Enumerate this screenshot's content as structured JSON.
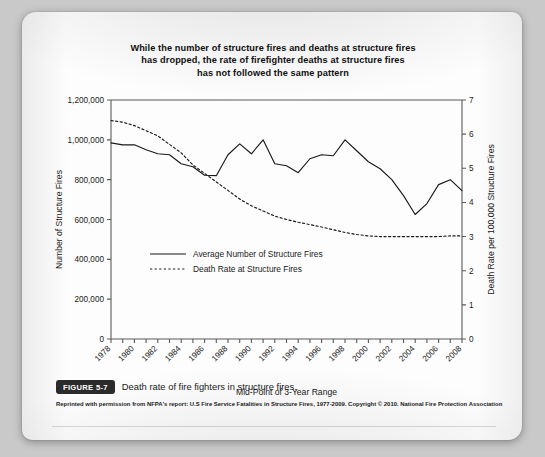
{
  "figure": {
    "badge": "FIGURE 5-7",
    "caption": "Death rate of fire fighters in structure fires.",
    "attribution": "Reprinted with permission from NFPA's report: U.S Fire Service Fatalities in Structure Fires, 1977-2009. Copyright © 2010. National Fire Protection Association"
  },
  "chart_data": {
    "type": "line",
    "title": "While the number of structure fires and deaths at structure fires has dropped, the rate of firefighter deaths at structure fires has not followed the same pattern",
    "title_lines": [
      "While the number of structure fires and deaths at structure fires",
      "has dropped, the rate of firefighter deaths at structure fires",
      "has not followed the same pattern"
    ],
    "xlabel": "Mid-Point of 3-Year Range",
    "ylabel": "Number of Structure Fires",
    "y2label": "Death Rate per 100,000 Structure Fires",
    "xlim": [
      1978,
      2008
    ],
    "ylim": [
      0,
      1200000
    ],
    "y2lim": [
      0,
      7
    ],
    "grid": false,
    "legend_position": "center-left",
    "y_ticks": [
      0,
      200000,
      400000,
      600000,
      800000,
      1000000,
      1200000
    ],
    "y_tick_labels": [
      "0",
      "200,000",
      "400,000",
      "600,000",
      "800,000",
      "1,000,000",
      "1,200,000"
    ],
    "y2_ticks": [
      0,
      1,
      2,
      3,
      4,
      5,
      6,
      7
    ],
    "y2_tick_labels": [
      "0",
      "1",
      "2",
      "3",
      "4",
      "5",
      "6",
      "7"
    ],
    "x_ticks": [
      1978,
      1979,
      1980,
      1981,
      1982,
      1983,
      1984,
      1985,
      1986,
      1987,
      1988,
      1989,
      1990,
      1991,
      1992,
      1993,
      1994,
      1995,
      1996,
      1997,
      1998,
      1999,
      2000,
      2001,
      2002,
      2003,
      2004,
      2005,
      2006,
      2007,
      2008
    ],
    "x_tick_labels_shown": [
      "1978",
      "1980",
      "1982",
      "1984",
      "1986",
      "1988",
      "1990",
      "1992",
      "1994",
      "1996",
      "1998",
      "2000",
      "2002",
      "2004",
      "2006",
      "2008"
    ],
    "x": [
      1978,
      1979,
      1980,
      1981,
      1982,
      1983,
      1984,
      1985,
      1986,
      1987,
      1988,
      1989,
      1990,
      1991,
      1992,
      1993,
      1994,
      1995,
      1996,
      1997,
      1998,
      1999,
      2000,
      2001,
      2002,
      2003,
      2004,
      2005,
      2006,
      2007,
      2008
    ],
    "series": [
      {
        "name": "Average Number of Structure Fires",
        "axis": "left",
        "style": "solid",
        "color": "#1a1a1a",
        "values": [
          985000,
          975000,
          975000,
          950000,
          930000,
          925000,
          880000,
          865000,
          822000,
          820000,
          925000,
          980000,
          930000,
          1000000,
          880000,
          870000,
          835000,
          905000,
          925000,
          920000,
          1000000,
          945000,
          890000,
          855000,
          800000,
          720000,
          625000,
          680000,
          775000,
          800000,
          745000
        ]
      },
      {
        "name": "Death Rate at Structure Fires",
        "axis": "right",
        "style": "dashed",
        "color": "#1a1a1a",
        "values": [
          6.4,
          6.35,
          6.25,
          6.1,
          5.95,
          5.7,
          5.45,
          5.1,
          4.85,
          4.6,
          4.35,
          4.1,
          3.9,
          3.75,
          3.6,
          3.5,
          3.42,
          3.35,
          3.28,
          3.2,
          3.12,
          3.06,
          3.02,
          3.0,
          3.0,
          3.0,
          3.0,
          3.0,
          3.0,
          3.02,
          3.02
        ]
      }
    ]
  }
}
